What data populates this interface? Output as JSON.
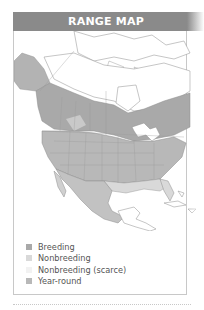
{
  "header": {
    "title": "RANGE MAP"
  },
  "colors": {
    "header_bg": "#8a8a8a",
    "breeding": "#a9a9a9",
    "nonbreeding": "#d9d9d9",
    "nonbreeding_scarce": "#f2f2f2",
    "year_round": "#b8b8b8",
    "border_lines": "#8c8c8c"
  },
  "map": {
    "region": "North America",
    "description": "Grayscale range map showing breeding (across Canada and northern US), year-round (western and central US), nonbreeding (southern US and Mexico)."
  },
  "legend": {
    "items": [
      {
        "label": "Breeding",
        "swatch": "breeding"
      },
      {
        "label": "Nonbreeding",
        "swatch": "nonbreeding"
      },
      {
        "label": "Nonbreeding (scarce)",
        "swatch": "nonbreeding_scarce"
      },
      {
        "label": "Year-round",
        "swatch": "year_round"
      }
    ]
  }
}
